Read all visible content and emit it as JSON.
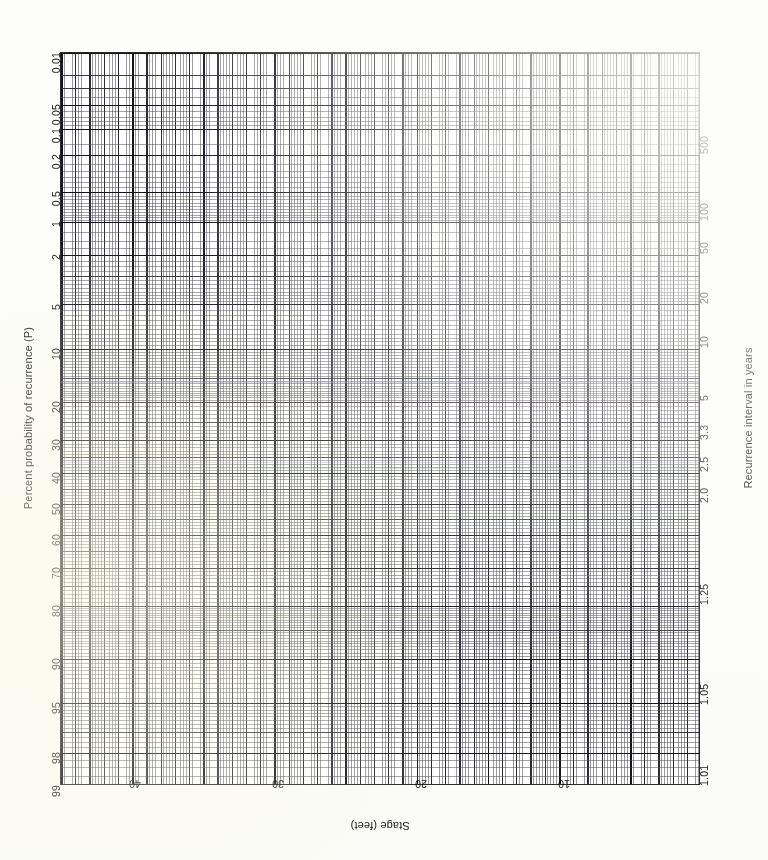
{
  "sheet": {
    "kind": "probability-plot-graph-paper",
    "paper_color": "#fdfdfb",
    "grid_color": "#2a2a2a"
  },
  "axes": {
    "left": {
      "title": "Percent probability of recurrence (P)",
      "ticks": [
        "0.01",
        "0.05",
        "0.1",
        "0.2",
        "0.5",
        "1",
        "2",
        "5",
        "10",
        "20",
        "30",
        "40",
        "50",
        "60",
        "70",
        "80",
        "90",
        "95",
        "98",
        "99"
      ]
    },
    "right": {
      "title": "Recurrence interval in years",
      "ticks": [
        "500",
        "100",
        "50",
        "20",
        "10",
        "5",
        "3.3",
        "2.5",
        "2.0",
        "1.25",
        "1.05",
        "1.01"
      ]
    },
    "bottom": {
      "title": "Stage (feet)",
      "ticks": [
        "40",
        "30",
        "20",
        "10"
      ]
    }
  },
  "chart_data": {
    "type": "line",
    "title": "",
    "subtitle": "",
    "xlabel": "Stage (feet)",
    "ylabel": "Percent probability of recurrence (P)",
    "y2label": "Recurrence interval in years",
    "grid": true,
    "legend": "none",
    "y_scale": "normal-probability",
    "x_scale": "linear",
    "xlim": [
      45,
      5
    ],
    "x_direction": "decreasing",
    "ylim": [
      0.01,
      99
    ],
    "y_direction": "decreasing-downward",
    "x_ticks": [
      40,
      30,
      20,
      10
    ],
    "x_tick_positions_px": [
      135,
      278,
      421,
      564
    ],
    "x_minor_step": 0.5,
    "x_major_step": 2.5,
    "x_heavy_step": 5,
    "y_ticks": [
      0.01,
      0.05,
      0.1,
      0.2,
      0.5,
      1,
      2,
      5,
      10,
      20,
      30,
      40,
      50,
      60,
      70,
      80,
      90,
      95,
      98,
      99
    ],
    "y2_ticks": [
      500,
      100,
      50,
      20,
      10,
      5,
      3.3,
      2.5,
      2.0,
      1.25,
      1.05,
      1.01
    ],
    "y2_relation": "T = 100 / P",
    "series": [],
    "values": [],
    "categories": [],
    "annotations": [],
    "note": "Blank normal-probability graph paper; no data series plotted. Faint coloured horizontal tints are scan colour-fringing artifacts, not data."
  },
  "fringes": [
    {
      "y_pct": 46.9,
      "color": "#6fa8b8"
    },
    {
      "y_pct": 47.6,
      "color": "#b05c6c"
    },
    {
      "y_pct": 55.8,
      "color": "#8f6fa8"
    },
    {
      "y_pct": 56.6,
      "color": "#7fae7a"
    },
    {
      "y_pct": 63.1,
      "color": "#7a9e6a"
    },
    {
      "y_pct": 71.2,
      "color": "#8a7fb0"
    },
    {
      "y_pct": 44.8,
      "color": "#7f8fc0"
    }
  ]
}
